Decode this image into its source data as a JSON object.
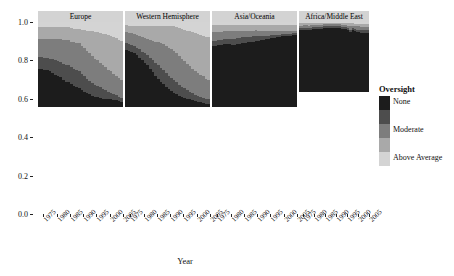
{
  "chart_data": {
    "type": "area",
    "title": "",
    "xlabel": "Year",
    "ylabel": "Proportion",
    "xlim": [
      1973,
      2005
    ],
    "ylim": [
      0,
      1
    ],
    "grid": false,
    "legend": {
      "title": "Oversight",
      "position": "right",
      "levels": [
        {
          "label": "None",
          "color": "#1c1c1c",
          "show_label": true
        },
        {
          "label": "",
          "color": "#4d4d4d",
          "show_label": false
        },
        {
          "label": "Moderate",
          "color": "#7d7d7d",
          "color_alt": "#7d7d7d",
          "show_label": true
        },
        {
          "label": "",
          "color": "#a9a9a9",
          "show_label": false
        },
        {
          "label": "Above Average",
          "color": "#d4d4d4",
          "show_label": true
        }
      ]
    },
    "xticks": [
      "1975",
      "1980",
      "1985",
      "1990",
      "1995",
      "2000",
      "2005"
    ],
    "xtick_values": [
      1975,
      1980,
      1985,
      1990,
      1995,
      2000,
      2005
    ],
    "yticks": [
      "0.0",
      "0.2",
      "0.4",
      "0.6",
      "0.8",
      "1.0"
    ],
    "ytick_values": [
      0.0,
      0.2,
      0.4,
      0.6,
      0.8,
      1.0
    ],
    "facet_variable": "region",
    "x": [
      1973,
      1974,
      1975,
      1976,
      1977,
      1978,
      1979,
      1980,
      1981,
      1982,
      1983,
      1984,
      1985,
      1986,
      1987,
      1988,
      1989,
      1990,
      1991,
      1992,
      1993,
      1994,
      1995,
      1996,
      1997,
      1998,
      1999,
      2000,
      2001,
      2002,
      2003,
      2004,
      2005
    ],
    "panels": [
      {
        "title": "Europe",
        "series": [
          {
            "name": "None",
            "values": [
              0.45,
              0.45,
              0.44,
              0.44,
              0.42,
              0.4,
              0.38,
              0.36,
              0.35,
              0.32,
              0.3,
              0.29,
              0.27,
              0.25,
              0.23,
              0.22,
              0.2,
              0.18,
              0.16,
              0.15,
              0.13,
              0.12,
              0.12,
              0.11,
              0.1,
              0.1,
              0.09,
              0.09,
              0.08,
              0.08,
              0.07,
              0.06,
              0.05
            ]
          },
          {
            "name": "level2",
            "values": [
              0.14,
              0.14,
              0.14,
              0.14,
              0.15,
              0.16,
              0.17,
              0.18,
              0.18,
              0.19,
              0.2,
              0.2,
              0.2,
              0.2,
              0.2,
              0.2,
              0.19,
              0.18,
              0.17,
              0.16,
              0.15,
              0.14,
              0.13,
              0.12,
              0.11,
              0.1,
              0.09,
              0.08,
              0.07,
              0.06,
              0.05,
              0.05,
              0.04
            ]
          },
          {
            "name": "Moderate",
            "values": [
              0.21,
              0.21,
              0.22,
              0.22,
              0.23,
              0.24,
              0.25,
              0.26,
              0.27,
              0.28,
              0.29,
              0.3,
              0.3,
              0.31,
              0.32,
              0.33,
              0.33,
              0.34,
              0.33,
              0.32,
              0.32,
              0.31,
              0.3,
              0.29,
              0.28,
              0.27,
              0.26,
              0.25,
              0.24,
              0.23,
              0.22,
              0.21,
              0.2
            ]
          },
          {
            "name": "level4",
            "values": [
              0.14,
              0.14,
              0.14,
              0.14,
              0.14,
              0.14,
              0.14,
              0.14,
              0.14,
              0.15,
              0.15,
              0.15,
              0.16,
              0.16,
              0.17,
              0.17,
              0.19,
              0.21,
              0.24,
              0.27,
              0.29,
              0.31,
              0.33,
              0.35,
              0.37,
              0.39,
              0.41,
              0.42,
              0.43,
              0.44,
              0.45,
              0.46,
              0.47
            ]
          },
          {
            "name": "Above Average",
            "values": [
              0.06,
              0.06,
              0.06,
              0.06,
              0.06,
              0.06,
              0.06,
              0.06,
              0.06,
              0.06,
              0.06,
              0.06,
              0.07,
              0.08,
              0.08,
              0.08,
              0.09,
              0.09,
              0.1,
              0.1,
              0.11,
              0.12,
              0.12,
              0.13,
              0.14,
              0.14,
              0.15,
              0.16,
              0.18,
              0.19,
              0.21,
              0.22,
              0.24
            ]
          }
        ]
      },
      {
        "title": "Western Hemisphere",
        "series": [
          {
            "name": "None",
            "values": [
              0.67,
              0.66,
              0.65,
              0.63,
              0.61,
              0.58,
              0.55,
              0.52,
              0.49,
              0.45,
              0.41,
              0.37,
              0.33,
              0.3,
              0.27,
              0.24,
              0.21,
              0.19,
              0.17,
              0.15,
              0.13,
              0.12,
              0.11,
              0.1,
              0.09,
              0.08,
              0.07,
              0.06,
              0.06,
              0.05,
              0.04,
              0.04,
              0.03
            ]
          },
          {
            "name": "level2",
            "values": [
              0.08,
              0.08,
              0.08,
              0.09,
              0.09,
              0.1,
              0.1,
              0.11,
              0.12,
              0.13,
              0.14,
              0.15,
              0.16,
              0.16,
              0.16,
              0.16,
              0.16,
              0.15,
              0.15,
              0.14,
              0.13,
              0.12,
              0.11,
              0.1,
              0.09,
              0.08,
              0.07,
              0.07,
              0.06,
              0.06,
              0.05,
              0.05,
              0.04
            ]
          },
          {
            "name": "Moderate",
            "values": [
              0.13,
              0.13,
              0.14,
              0.14,
              0.15,
              0.16,
              0.17,
              0.18,
              0.19,
              0.21,
              0.23,
              0.25,
              0.27,
              0.29,
              0.31,
              0.32,
              0.33,
              0.34,
              0.34,
              0.34,
              0.34,
              0.33,
              0.32,
              0.31,
              0.3,
              0.29,
              0.28,
              0.27,
              0.26,
              0.25,
              0.24,
              0.23,
              0.22
            ]
          },
          {
            "name": "level4",
            "values": [
              0.08,
              0.08,
              0.08,
              0.09,
              0.1,
              0.11,
              0.13,
              0.14,
              0.15,
              0.16,
              0.17,
              0.18,
              0.19,
              0.2,
              0.21,
              0.23,
              0.25,
              0.27,
              0.29,
              0.31,
              0.33,
              0.35,
              0.37,
              0.39,
              0.41,
              0.43,
              0.45,
              0.46,
              0.47,
              0.48,
              0.49,
              0.5,
              0.51
            ]
          },
          {
            "name": "Above Average",
            "values": [
              0.04,
              0.05,
              0.05,
              0.05,
              0.05,
              0.05,
              0.05,
              0.05,
              0.05,
              0.05,
              0.05,
              0.05,
              0.05,
              0.05,
              0.05,
              0.05,
              0.05,
              0.05,
              0.05,
              0.06,
              0.07,
              0.08,
              0.09,
              0.1,
              0.11,
              0.12,
              0.13,
              0.14,
              0.15,
              0.16,
              0.18,
              0.18,
              0.2
            ]
          }
        ]
      },
      {
        "title": "Asia/Oceania",
        "series": [
          {
            "name": "None",
            "values": [
              0.72,
              0.72,
              0.73,
              0.73,
              0.74,
              0.74,
              0.74,
              0.73,
              0.73,
              0.74,
              0.74,
              0.75,
              0.75,
              0.76,
              0.76,
              0.77,
              0.78,
              0.78,
              0.79,
              0.79,
              0.8,
              0.8,
              0.81,
              0.81,
              0.82,
              0.82,
              0.83,
              0.83,
              0.84,
              0.84,
              0.85,
              0.85,
              0.86
            ]
          },
          {
            "name": "level2",
            "values": [
              0.06,
              0.06,
              0.06,
              0.06,
              0.06,
              0.06,
              0.06,
              0.07,
              0.07,
              0.07,
              0.07,
              0.07,
              0.07,
              0.06,
              0.06,
              0.06,
              0.06,
              0.05,
              0.05,
              0.05,
              0.04,
              0.04,
              0.04,
              0.04,
              0.03,
              0.03,
              0.03,
              0.03,
              0.02,
              0.02,
              0.02,
              0.02,
              0.02
            ]
          },
          {
            "name": "Moderate",
            "values": [
              0.1,
              0.1,
              0.09,
              0.09,
              0.09,
              0.09,
              0.09,
              0.09,
              0.09,
              0.08,
              0.08,
              0.08,
              0.08,
              0.08,
              0.08,
              0.07,
              0.07,
              0.07,
              0.06,
              0.06,
              0.06,
              0.06,
              0.05,
              0.05,
              0.05,
              0.05,
              0.04,
              0.04,
              0.04,
              0.04,
              0.03,
              0.03,
              0.03
            ]
          },
          {
            "name": "level4",
            "values": [
              0.08,
              0.08,
              0.08,
              0.08,
              0.07,
              0.07,
              0.07,
              0.07,
              0.07,
              0.07,
              0.07,
              0.06,
              0.06,
              0.06,
              0.06,
              0.06,
              0.05,
              0.06,
              0.06,
              0.06,
              0.06,
              0.06,
              0.06,
              0.06,
              0.06,
              0.06,
              0.06,
              0.06,
              0.06,
              0.06,
              0.06,
              0.06,
              0.05
            ]
          },
          {
            "name": "Above Average",
            "values": [
              0.04,
              0.04,
              0.04,
              0.04,
              0.04,
              0.04,
              0.04,
              0.04,
              0.04,
              0.04,
              0.04,
              0.04,
              0.04,
              0.04,
              0.04,
              0.04,
              0.04,
              0.04,
              0.04,
              0.04,
              0.04,
              0.04,
              0.04,
              0.04,
              0.04,
              0.04,
              0.04,
              0.04,
              0.04,
              0.04,
              0.04,
              0.04,
              0.04
            ]
          }
        ]
      },
      {
        "title": "Africa/Middle East",
        "series": [
          {
            "name": "None",
            "values": [
              0.88,
              0.88,
              0.89,
              0.89,
              0.88,
              0.89,
              0.9,
              0.9,
              0.9,
              0.9,
              0.9,
              0.91,
              0.91,
              0.91,
              0.91,
              0.91,
              0.91,
              0.91,
              0.91,
              0.9,
              0.9,
              0.9,
              0.88,
              0.86,
              0.88,
              0.87,
              0.86,
              0.86,
              0.85,
              0.85,
              0.85,
              0.85,
              0.84
            ]
          },
          {
            "name": "level2",
            "values": [
              0.03,
              0.03,
              0.03,
              0.03,
              0.03,
              0.03,
              0.03,
              0.03,
              0.03,
              0.03,
              0.03,
              0.03,
              0.03,
              0.03,
              0.03,
              0.03,
              0.03,
              0.03,
              0.03,
              0.03,
              0.03,
              0.03,
              0.03,
              0.03,
              0.03,
              0.03,
              0.03,
              0.03,
              0.03,
              0.03,
              0.03,
              0.03,
              0.03
            ]
          },
          {
            "name": "Moderate",
            "values": [
              0.04,
              0.04,
              0.04,
              0.04,
              0.04,
              0.04,
              0.03,
              0.03,
              0.03,
              0.03,
              0.03,
              0.03,
              0.03,
              0.03,
              0.03,
              0.03,
              0.03,
              0.03,
              0.03,
              0.03,
              0.03,
              0.03,
              0.04,
              0.05,
              0.04,
              0.04,
              0.05,
              0.05,
              0.05,
              0.05,
              0.05,
              0.05,
              0.06
            ]
          },
          {
            "name": "level4",
            "values": [
              0.03,
              0.03,
              0.02,
              0.02,
              0.03,
              0.02,
              0.02,
              0.02,
              0.02,
              0.02,
              0.02,
              0.02,
              0.02,
              0.02,
              0.02,
              0.02,
              0.02,
              0.02,
              0.02,
              0.02,
              0.02,
              0.02,
              0.03,
              0.04,
              0.03,
              0.03,
              0.03,
              0.03,
              0.04,
              0.04,
              0.04,
              0.04,
              0.04
            ]
          },
          {
            "name": "Above Average",
            "values": [
              0.02,
              0.02,
              0.02,
              0.02,
              0.02,
              0.02,
              0.02,
              0.02,
              0.02,
              0.02,
              0.02,
              0.01,
              0.01,
              0.01,
              0.01,
              0.01,
              0.01,
              0.01,
              0.01,
              0.02,
              0.02,
              0.02,
              0.02,
              0.02,
              0.02,
              0.03,
              0.03,
              0.03,
              0.03,
              0.03,
              0.03,
              0.03,
              0.03
            ]
          }
        ]
      }
    ]
  }
}
